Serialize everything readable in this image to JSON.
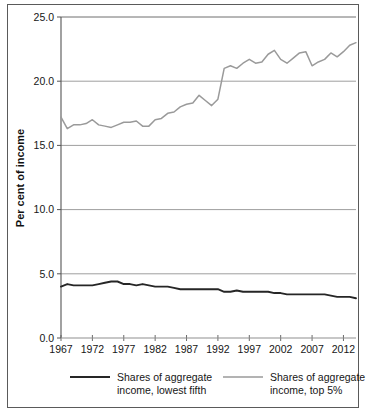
{
  "chart_data": {
    "type": "line",
    "title": "",
    "xlabel": "",
    "ylabel": "Per cent of income",
    "xlim": [
      1967,
      2014
    ],
    "ylim": [
      0.0,
      25.0
    ],
    "grid": "horizontal",
    "legend_position": "bottom",
    "y_ticks": [
      "0.0",
      "5.0",
      "10.0",
      "15.0",
      "20.0",
      "25.0"
    ],
    "y_tick_values": [
      0.0,
      5.0,
      10.0,
      15.0,
      20.0,
      25.0
    ],
    "x_ticks": [
      "1967",
      "1972",
      "1977",
      "1982",
      "1987",
      "1992",
      "1997",
      "2002",
      "2007",
      "2012"
    ],
    "x_tick_values": [
      1967,
      1972,
      1977,
      1982,
      1987,
      1992,
      1997,
      2002,
      2007,
      2012
    ],
    "x": [
      1967,
      1968,
      1969,
      1970,
      1971,
      1972,
      1973,
      1974,
      1975,
      1976,
      1977,
      1978,
      1979,
      1980,
      1981,
      1982,
      1983,
      1984,
      1985,
      1986,
      1987,
      1988,
      1989,
      1990,
      1991,
      1992,
      1993,
      1994,
      1995,
      1996,
      1997,
      1998,
      1999,
      2000,
      2001,
      2002,
      2003,
      2004,
      2005,
      2006,
      2007,
      2008,
      2009,
      2010,
      2011,
      2012,
      2013,
      2014
    ],
    "series": [
      {
        "name": "Shares of aggregate income, lowest fifth",
        "color": "#262626",
        "values": [
          4.0,
          4.2,
          4.1,
          4.1,
          4.1,
          4.1,
          4.2,
          4.3,
          4.4,
          4.4,
          4.2,
          4.2,
          4.1,
          4.2,
          4.1,
          4.0,
          4.0,
          4.0,
          3.9,
          3.8,
          3.8,
          3.8,
          3.8,
          3.8,
          3.8,
          3.8,
          3.6,
          3.6,
          3.7,
          3.6,
          3.6,
          3.6,
          3.6,
          3.6,
          3.5,
          3.5,
          3.4,
          3.4,
          3.4,
          3.4,
          3.4,
          3.4,
          3.4,
          3.3,
          3.2,
          3.2,
          3.2,
          3.1
        ]
      },
      {
        "name": "Shares of aggregate income, top 5%",
        "color": "#9a9a9a",
        "values": [
          17.2,
          16.3,
          16.6,
          16.6,
          16.7,
          17.0,
          16.6,
          16.5,
          16.4,
          16.6,
          16.8,
          16.8,
          16.9,
          16.5,
          16.5,
          17.0,
          17.1,
          17.5,
          17.6,
          18.0,
          18.2,
          18.3,
          18.9,
          18.5,
          18.1,
          18.6,
          21.0,
          21.2,
          21.0,
          21.4,
          21.7,
          21.4,
          21.5,
          22.1,
          22.4,
          21.7,
          21.4,
          21.8,
          22.2,
          22.3,
          21.2,
          21.5,
          21.7,
          22.2,
          21.9,
          22.3,
          22.8,
          23.0
        ]
      }
    ]
  },
  "legend": {
    "items": [
      {
        "label_line1": "Shares of aggregate",
        "label_line2": "income, lowest fifth",
        "color": "#262626"
      },
      {
        "label_line1": "Shares of aggregate",
        "label_line2": "income, top 5%",
        "color": "#9a9a9a"
      }
    ]
  }
}
